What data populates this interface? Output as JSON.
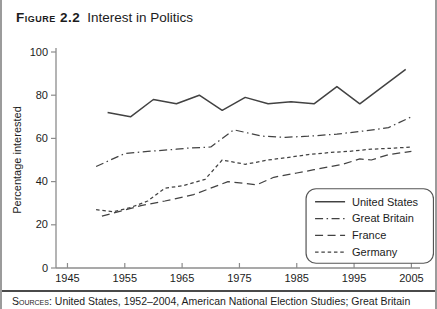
{
  "figure": {
    "label": "Figure 2.2",
    "title": "Interest in Politics"
  },
  "source_note": {
    "prefix": "Sources:",
    "text": " United States, 1952–2004, American National Election Studies; Great Britain"
  },
  "colors": {
    "line": "#424242",
    "axis": "#8c8c8c",
    "text": "#1c1c1c",
    "legend_border": "#555555",
    "border": "#9b9b9b",
    "rule": "#4a4a4a",
    "background": "#ffffff"
  },
  "chart_data": {
    "type": "line",
    "title": "Interest in Politics",
    "figure_label": "Figure 2.2",
    "xlabel": "",
    "ylabel": "Percentage interested",
    "xlim": [
      1945,
      2005
    ],
    "ylim": [
      0,
      100
    ],
    "xticks": [
      1945,
      1955,
      1965,
      1975,
      1985,
      1995,
      2005
    ],
    "yticks": [
      0,
      20,
      40,
      60,
      80,
      100
    ],
    "grid": false,
    "legend_position": "lower right",
    "series": [
      {
        "name": "United States",
        "line_style": "solid",
        "points": [
          [
            1952,
            72
          ],
          [
            1956,
            70
          ],
          [
            1960,
            78
          ],
          [
            1964,
            76
          ],
          [
            1968,
            80
          ],
          [
            1972,
            73
          ],
          [
            1976,
            79
          ],
          [
            1980,
            76
          ],
          [
            1984,
            77
          ],
          [
            1988,
            76
          ],
          [
            1992,
            84
          ],
          [
            1996,
            76
          ],
          [
            2000,
            84
          ],
          [
            2004,
            92
          ]
        ]
      },
      {
        "name": "Great Britain",
        "line_style": "dash-dot",
        "points": [
          [
            1950,
            47
          ],
          [
            1955,
            53
          ],
          [
            1959,
            54
          ],
          [
            1964,
            55
          ],
          [
            1966,
            55.5
          ],
          [
            1970,
            56
          ],
          [
            1974,
            64
          ],
          [
            1979,
            61
          ],
          [
            1983,
            60.5
          ],
          [
            1987,
            61
          ],
          [
            1992,
            62
          ],
          [
            1997,
            63.5
          ],
          [
            2001,
            65
          ],
          [
            2005,
            70
          ]
        ]
      },
      {
        "name": "France",
        "line_style": "long-dash",
        "points": [
          [
            1951,
            24
          ],
          [
            1958,
            29
          ],
          [
            1962,
            31
          ],
          [
            1967,
            34
          ],
          [
            1973,
            40
          ],
          [
            1978,
            38.5
          ],
          [
            1981,
            42
          ],
          [
            1985,
            44
          ],
          [
            1988,
            45.5
          ],
          [
            1993,
            48
          ],
          [
            1996,
            50.5
          ],
          [
            1998,
            50
          ],
          [
            2001,
            52.5
          ],
          [
            2005,
            54
          ]
        ]
      },
      {
        "name": "Germany",
        "line_style": "short-dash",
        "points": [
          [
            1950,
            27
          ],
          [
            1953,
            26
          ],
          [
            1956,
            28
          ],
          [
            1959,
            31
          ],
          [
            1962,
            37
          ],
          [
            1965,
            38
          ],
          [
            1969,
            41
          ],
          [
            1972,
            50
          ],
          [
            1976,
            48
          ],
          [
            1980,
            50
          ],
          [
            1983,
            51
          ],
          [
            1987,
            52.5
          ],
          [
            1991,
            53.5
          ],
          [
            1994,
            54
          ],
          [
            1998,
            55
          ],
          [
            2002,
            55.5
          ],
          [
            2005,
            56
          ]
        ]
      }
    ]
  }
}
